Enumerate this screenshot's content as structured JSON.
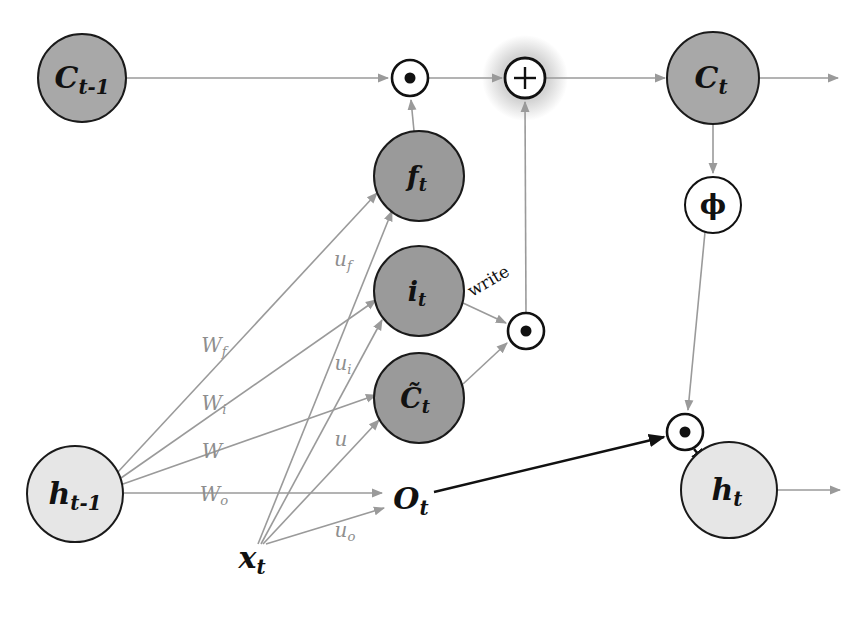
{
  "diagram": {
    "canvas": {
      "width": 866,
      "height": 639,
      "background": "#ffffff"
    },
    "colors": {
      "cell_state_fill": "#a8a8a8",
      "gate_fill": "#9a9a9a",
      "hidden_fill": "#e6e6e6",
      "operator_fill": "#ffffff",
      "operator_stroke": "#111111",
      "glow_fill": "#d4d4d4",
      "edge_gray": "#9a9a9a",
      "edge_black": "#111111",
      "weight_text": "#8e8e8e",
      "node_text": "#111111",
      "node_stroke": "#1a1a1a"
    }
  },
  "nodes": {
    "c_prev": {
      "label": "C",
      "sub": "t-1",
      "x": 82,
      "y": 78,
      "r": 44,
      "fill": "#a8a8a8",
      "kind": "state"
    },
    "f_gate": {
      "label": "f",
      "sub": "t",
      "x": 419,
      "y": 176,
      "r": 45,
      "fill": "#9a9a9a",
      "kind": "gate"
    },
    "i_gate": {
      "label": "i",
      "sub": "t",
      "x": 419,
      "y": 291,
      "r": 45,
      "fill": "#9a9a9a",
      "kind": "gate"
    },
    "c_tilde": {
      "label": "C̃",
      "sub": "t",
      "x": 419,
      "y": 398,
      "r": 45,
      "fill": "#9a9a9a",
      "kind": "gate"
    },
    "c_next": {
      "label": "C",
      "sub": "t",
      "x": 713,
      "y": 78,
      "r": 46,
      "fill": "#a8a8a8",
      "kind": "state"
    },
    "h_prev": {
      "label": "h",
      "sub": "t-1",
      "x": 75,
      "y": 494,
      "r": 48,
      "fill": "#e6e6e6",
      "kind": "hidden"
    },
    "h_next": {
      "label": "h",
      "sub": "t",
      "x": 729,
      "y": 490,
      "r": 48,
      "fill": "#e6e6e6",
      "kind": "hidden"
    },
    "phi": {
      "label": "ϕ",
      "sub": "",
      "x": 713,
      "y": 205,
      "r": 28,
      "fill": "#ffffff",
      "kind": "activation"
    },
    "x_t": {
      "label": "x",
      "sub": "t",
      "x": 252,
      "y": 558,
      "r": 0,
      "fill": "none",
      "kind": "free"
    },
    "o_t": {
      "label": "O",
      "sub": "t",
      "x": 411,
      "y": 499,
      "r": 0,
      "fill": "none",
      "kind": "free"
    }
  },
  "operators": [
    {
      "id": "forget_mult",
      "symbol": "●",
      "op_name": "element-wise-multiply",
      "x": 410,
      "y": 78,
      "r": 18,
      "glow": false
    },
    {
      "id": "state_add",
      "symbol": "+",
      "op_name": "element-wise-add",
      "x": 525,
      "y": 78,
      "r": 20,
      "glow": true,
      "glow_r": 42
    },
    {
      "id": "write_mult",
      "symbol": "●",
      "op_name": "element-wise-multiply",
      "x": 526,
      "y": 331,
      "r": 18,
      "glow": false
    },
    {
      "id": "output_mult",
      "symbol": "●",
      "op_name": "element-wise-multiply",
      "x": 685,
      "y": 432,
      "r": 18,
      "glow": false
    }
  ],
  "weight_labels": [
    {
      "id": "W_f",
      "base": "W",
      "sub": "f",
      "x": 214,
      "y": 346
    },
    {
      "id": "W_i",
      "base": "W",
      "sub": "i",
      "x": 214,
      "y": 404
    },
    {
      "id": "W",
      "base": "W",
      "sub": "",
      "x": 212,
      "y": 452
    },
    {
      "id": "W_o",
      "base": "W",
      "sub": "o",
      "x": 214,
      "y": 495
    },
    {
      "id": "u_f",
      "base": "u",
      "sub": "f",
      "x": 343,
      "y": 260
    },
    {
      "id": "u_i",
      "base": "u",
      "sub": "i",
      "x": 343,
      "y": 364
    },
    {
      "id": "u",
      "base": "u",
      "sub": "",
      "x": 341,
      "y": 440
    },
    {
      "id": "u_o",
      "base": "u",
      "sub": "o",
      "x": 345,
      "y": 531
    }
  ],
  "edge_labels": [
    {
      "id": "write",
      "text": "write",
      "x": 489,
      "y": 282,
      "rotate": -30
    }
  ],
  "edges": [
    {
      "id": "c_prev-to-forget_mult",
      "from": "c_prev",
      "to": "forget_mult",
      "color": "#9a9a9a"
    },
    {
      "id": "forget_mult-to-add",
      "from": "forget_mult",
      "to": "state_add",
      "color": "#9a9a9a"
    },
    {
      "id": "add-to-c_next",
      "from": "state_add",
      "to": "c_next",
      "color": "#9a9a9a"
    },
    {
      "id": "c_next-output",
      "from": "c_next",
      "to": "right-edge",
      "color": "#9a9a9a"
    },
    {
      "id": "f_gate-to-forget_mult",
      "from": "f_gate",
      "to": "forget_mult",
      "color": "#9a9a9a"
    },
    {
      "id": "write_mult-to-add",
      "from": "write_mult",
      "to": "state_add",
      "color": "#9a9a9a"
    },
    {
      "id": "i_gate-to-write_mult",
      "from": "i_gate",
      "to": "write_mult",
      "color": "#9a9a9a"
    },
    {
      "id": "c_tilde-to-write_mult",
      "from": "c_tilde",
      "to": "write_mult",
      "color": "#9a9a9a"
    },
    {
      "id": "c_next-to-phi",
      "from": "c_next",
      "to": "phi",
      "color": "#9a9a9a"
    },
    {
      "id": "phi-to-output_mult",
      "from": "phi",
      "to": "output_mult",
      "color": "#9a9a9a"
    },
    {
      "id": "o_t-to-output_mult",
      "from": "o_t",
      "to": "output_mult",
      "color": "#111111"
    },
    {
      "id": "output_mult-to-h_next",
      "from": "output_mult",
      "to": "h_next",
      "color": "#111111"
    },
    {
      "id": "h_next-output",
      "from": "h_next",
      "to": "right-edge",
      "color": "#9a9a9a"
    },
    {
      "id": "h_prev-to-f_gate",
      "from": "h_prev",
      "to": "f_gate",
      "color": "#9a9a9a"
    },
    {
      "id": "h_prev-to-i_gate",
      "from": "h_prev",
      "to": "i_gate",
      "color": "#9a9a9a"
    },
    {
      "id": "h_prev-to-c_tilde",
      "from": "h_prev",
      "to": "c_tilde",
      "color": "#9a9a9a"
    },
    {
      "id": "h_prev-to-o_t",
      "from": "h_prev",
      "to": "o_t",
      "color": "#9a9a9a"
    },
    {
      "id": "x_t-to-f_gate",
      "from": "x_t",
      "to": "f_gate",
      "color": "#9a9a9a"
    },
    {
      "id": "x_t-to-i_gate",
      "from": "x_t",
      "to": "i_gate",
      "color": "#9a9a9a"
    },
    {
      "id": "x_t-to-c_tilde",
      "from": "x_t",
      "to": "c_tilde",
      "color": "#9a9a9a"
    },
    {
      "id": "x_t-to-o_t",
      "from": "x_t",
      "to": "o_t",
      "color": "#9a9a9a"
    }
  ]
}
